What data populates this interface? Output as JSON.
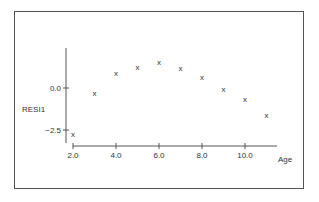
{
  "chart_data": {
    "type": "scatter",
    "title": "",
    "xlabel": "Age",
    "ylabel": "RESI1",
    "x": [
      2,
      3,
      4,
      5,
      6,
      7,
      8,
      9,
      10,
      11
    ],
    "y": [
      -2.75,
      -0.3,
      0.9,
      1.25,
      1.55,
      1.2,
      0.65,
      -0.05,
      -0.65,
      -1.6
    ],
    "marker": "x",
    "x_ticks": [
      "2.0",
      "4.0",
      "6.0",
      "8.0",
      "10.0"
    ],
    "y_ticks": [
      "0.0",
      "-2.5"
    ],
    "xlim": [
      2,
      12
    ],
    "ylim": [
      -3.5,
      2.5
    ],
    "grid": false,
    "legend": null
  }
}
